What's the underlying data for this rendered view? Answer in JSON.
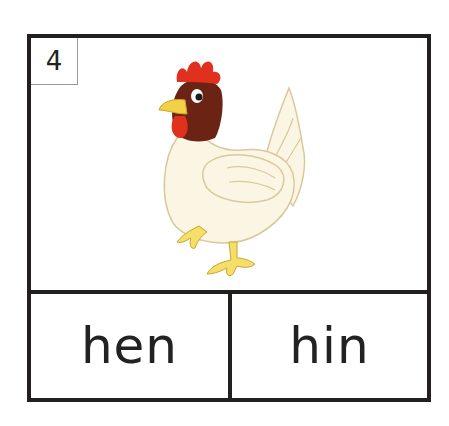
{
  "card": {
    "number": "4",
    "image": {
      "subject": "hen",
      "icon": "hen-illustration"
    },
    "choices": [
      {
        "label": "hen"
      },
      {
        "label": "hin"
      }
    ]
  },
  "colors": {
    "border": "#231f1f",
    "comb": "#e0301e",
    "head": "#6b2314",
    "beak": "#f2d048",
    "body": "#fbf6e4",
    "feet": "#f6de6a"
  }
}
